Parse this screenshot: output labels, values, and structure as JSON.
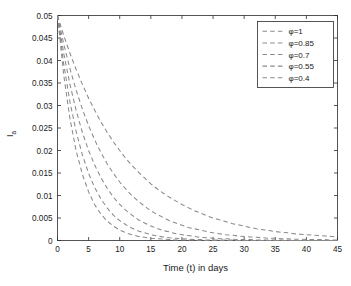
{
  "chart_data": {
    "type": "line",
    "title": "",
    "subtitle": "",
    "xlabel": "Time (t) in days",
    "ylabel": "I_a",
    "ylabel_base": "I",
    "ylabel_sub": "a",
    "xlim": [
      0,
      45
    ],
    "ylim": [
      0,
      0.05
    ],
    "xticks": [
      0,
      5,
      10,
      15,
      20,
      25,
      30,
      35,
      40,
      45
    ],
    "xticklabels": [
      "0",
      "5",
      "10",
      "15",
      "20",
      "25",
      "30",
      "35",
      "40",
      "45"
    ],
    "yticks": [
      0,
      0.005,
      0.01,
      0.015,
      0.02,
      0.025,
      0.03,
      0.035,
      0.04,
      0.045,
      0.05
    ],
    "yticklabels": [
      "0",
      "0.005",
      "0.01",
      "0.015",
      "0.02",
      "0.025",
      "0.03",
      "0.035",
      "0.04",
      "0.045",
      "0.05"
    ],
    "grid": false,
    "legend_position": "upper right",
    "line_style": "dashed",
    "line_color": "#7d7d7d",
    "axes_color": "#2b2b2b",
    "background": "#ffffff",
    "series": [
      {
        "name": "φ=1",
        "phi": 1,
        "color": "#8a8a8a",
        "x": [
          0,
          1,
          2,
          3,
          4,
          5,
          6,
          7,
          8,
          9,
          10,
          11,
          12,
          13,
          14,
          15,
          16,
          17,
          18,
          19,
          20,
          21,
          22,
          23,
          24,
          25,
          26,
          27,
          28,
          29,
          30,
          31,
          32,
          33,
          34,
          35,
          36,
          37,
          38,
          39,
          40,
          41,
          42,
          43,
          44,
          45
        ],
        "values": [
          0.05,
          0.0456,
          0.0416,
          0.038,
          0.0347,
          0.0316,
          0.0289,
          0.0263,
          0.024,
          0.0219,
          0.02,
          0.0182,
          0.0166,
          0.0152,
          0.0139,
          0.0126,
          0.0115,
          0.0105,
          0.0096,
          0.0088,
          0.008,
          0.0073,
          0.0066,
          0.0061,
          0.0055,
          0.005,
          0.0046,
          0.0042,
          0.0038,
          0.0035,
          0.0032,
          0.0029,
          0.0026,
          0.0024,
          0.0022,
          0.002,
          0.0018,
          0.0017,
          0.0015,
          0.0014,
          0.0013,
          0.0012,
          0.0011,
          0.001,
          0.0009,
          0.0008
        ]
      },
      {
        "name": "φ=0.85",
        "phi": 0.85,
        "color": "#8a8a8a",
        "x": [
          0,
          1,
          2,
          3,
          4,
          5,
          6,
          7,
          8,
          9,
          10,
          11,
          12,
          13,
          14,
          15,
          16,
          17,
          18,
          19,
          20,
          21,
          22,
          23,
          24,
          25,
          26,
          27,
          28,
          29,
          30,
          31,
          32,
          33,
          34,
          35,
          36,
          37,
          38,
          39,
          40,
          41,
          42,
          43,
          44,
          45
        ],
        "values": [
          0.05,
          0.0437,
          0.0382,
          0.0334,
          0.0292,
          0.0255,
          0.0223,
          0.0195,
          0.017,
          0.0149,
          0.013,
          0.0114,
          0.0099,
          0.0087,
          0.0076,
          0.0066,
          0.0058,
          0.0051,
          0.0044,
          0.0039,
          0.0034,
          0.0029,
          0.0026,
          0.0023,
          0.002,
          0.0017,
          0.0015,
          0.0013,
          0.0012,
          0.001,
          0.0009,
          0.0008,
          0.0007,
          0.0006,
          0.0005,
          0.0005,
          0.0004,
          0.0004,
          0.0003,
          0.0003,
          0.0002,
          0.0002,
          0.0002,
          0.0002,
          0.0001,
          0.0001
        ]
      },
      {
        "name": "φ=0.7",
        "phi": 0.7,
        "color": "#8a8a8a",
        "x": [
          0,
          1,
          2,
          3,
          4,
          5,
          6,
          7,
          8,
          9,
          10,
          11,
          12,
          13,
          14,
          15,
          16,
          17,
          18,
          19,
          20,
          21,
          22,
          23,
          24,
          25,
          26,
          27,
          28,
          29,
          30,
          31,
          32,
          33,
          34,
          35,
          36,
          37,
          38,
          39,
          40,
          41,
          42,
          43,
          44,
          45
        ],
        "values": [
          0.05,
          0.0416,
          0.0347,
          0.0289,
          0.024,
          0.02,
          0.0167,
          0.0139,
          0.0116,
          0.0096,
          0.008,
          0.0067,
          0.0056,
          0.0046,
          0.0039,
          0.0032,
          0.0027,
          0.0022,
          0.0019,
          0.0015,
          0.0013,
          0.0011,
          0.0009,
          0.0007,
          0.0006,
          0.0005,
          0.0004,
          0.0004,
          0.0003,
          0.0002,
          0.0002,
          0.0002,
          0.0001,
          0.0001,
          0.0001,
          0.0001,
          0.0001,
          0.0001,
          0.0,
          0.0,
          0.0,
          0.0,
          0.0,
          0.0,
          0.0,
          0.0
        ]
      },
      {
        "name": "φ=0.55",
        "phi": 0.55,
        "color": "#8a8a8a",
        "x": [
          0,
          1,
          2,
          3,
          4,
          5,
          6,
          7,
          8,
          9,
          10,
          11,
          12,
          13,
          14,
          15,
          16,
          17,
          18,
          19,
          20,
          21,
          22,
          23,
          24,
          25,
          26,
          27,
          28,
          29,
          30,
          31,
          32,
          33,
          34,
          35,
          36,
          37,
          38,
          39,
          40,
          41,
          42,
          43,
          44,
          45
        ],
        "values": [
          0.05,
          0.0392,
          0.0308,
          0.0242,
          0.019,
          0.0149,
          0.0117,
          0.0092,
          0.0072,
          0.0056,
          0.0044,
          0.0035,
          0.0027,
          0.0021,
          0.0017,
          0.0013,
          0.001,
          0.0008,
          0.0006,
          0.0005,
          0.0004,
          0.0003,
          0.0002,
          0.0002,
          0.0001,
          0.0001,
          0.0001,
          0.0001,
          0.0001,
          0.0,
          0.0,
          0.0,
          0.0,
          0.0,
          0.0,
          0.0,
          0.0,
          0.0,
          0.0,
          0.0,
          0.0,
          0.0,
          0.0,
          0.0,
          0.0,
          0.0
        ]
      },
      {
        "name": "φ=0.4",
        "phi": 0.4,
        "color": "#8a8a8a",
        "x": [
          0,
          1,
          2,
          3,
          4,
          5,
          6,
          7,
          8,
          9,
          10,
          11,
          12,
          13,
          14,
          15,
          16,
          17,
          18,
          19,
          20,
          21,
          22,
          23,
          24,
          25,
          26,
          27,
          28,
          29,
          30,
          31,
          32,
          33,
          34,
          35,
          36,
          37,
          38,
          39,
          40,
          41,
          42,
          43,
          44,
          45
        ],
        "values": [
          0.05,
          0.0368,
          0.0271,
          0.0199,
          0.0147,
          0.0108,
          0.0079,
          0.0058,
          0.0043,
          0.0032,
          0.0023,
          0.0017,
          0.0013,
          0.0009,
          0.0007,
          0.0005,
          0.0004,
          0.0003,
          0.0002,
          0.0001,
          0.0001,
          0.0001,
          0.0001,
          0.0,
          0.0,
          0.0,
          0.0,
          0.0,
          0.0,
          0.0,
          0.0,
          0.0,
          0.0,
          0.0,
          0.0,
          0.0,
          0.0,
          0.0,
          0.0,
          0.0,
          0.0,
          0.0,
          0.0,
          0.0,
          0.0,
          0.0
        ]
      }
    ],
    "legend_entries": [
      "φ=1",
      "φ=0.85",
      "φ=0.7",
      "φ=0.55",
      "φ=0.4"
    ]
  }
}
